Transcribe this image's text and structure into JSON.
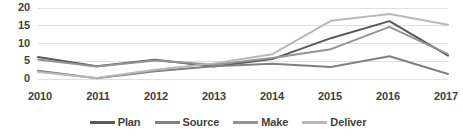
{
  "chart_data": {
    "type": "line",
    "title": "",
    "subtitle": "",
    "xlabel": "",
    "ylabel": "",
    "categories": [
      "2010",
      "2011",
      "2012",
      "2013",
      "2014",
      "2015",
      "2016",
      "2017"
    ],
    "x": [
      2010,
      2011,
      2012,
      2013,
      2014,
      2015,
      2016,
      2017
    ],
    "ylim": [
      0,
      20
    ],
    "yticks": [
      0,
      5,
      10,
      15,
      20
    ],
    "ytick_labels": [
      "0",
      "5",
      "10",
      "15",
      "20"
    ],
    "grid": true,
    "grid_axis": "y",
    "legend_position": "bottom",
    "series": [
      {
        "name": "Plan",
        "color": "#595959",
        "values": [
          6.2,
          3.6,
          5.4,
          3.5,
          5.6,
          11.5,
          16.3,
          6.6
        ]
      },
      {
        "name": "Source",
        "color": "#808080",
        "values": [
          2.3,
          0.2,
          2.2,
          3.6,
          4.3,
          3.4,
          6.4,
          1.4
        ]
      },
      {
        "name": "Make",
        "color": "#939393",
        "values": [
          5.5,
          3.5,
          5.2,
          4.0,
          5.9,
          8.4,
          14.7,
          7.0
        ]
      },
      {
        "name": "Deliver",
        "color": "#b8b8b8",
        "values": [
          2.0,
          0.3,
          2.6,
          4.4,
          7.0,
          16.4,
          18.3,
          15.3
        ]
      }
    ]
  },
  "axes": {
    "y_tick_labels": [
      "20",
      "15",
      "10",
      "5",
      "0"
    ],
    "x_tick_labels": [
      "2010",
      "2011",
      "2012",
      "2013",
      "2014",
      "2015",
      "2016",
      "2017"
    ]
  },
  "legend": {
    "items": [
      {
        "label": "Plan",
        "color": "#595959"
      },
      {
        "label": "Source",
        "color": "#808080"
      },
      {
        "label": "Make",
        "color": "#939393"
      },
      {
        "label": "Deliver",
        "color": "#b8b8b8"
      }
    ]
  },
  "style": {
    "background": "#ffffff",
    "gridline_color": "#e0e0e0",
    "text_color": "#3f3f3f"
  }
}
